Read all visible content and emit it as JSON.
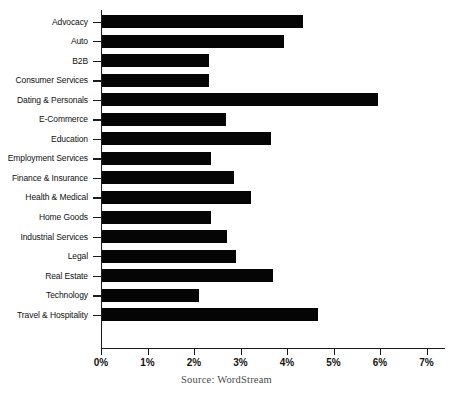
{
  "chart_data": {
    "type": "bar",
    "orientation": "horizontal",
    "title": "",
    "subtitle": "",
    "xlabel": "",
    "ylabel": "",
    "xlim": [
      0,
      7.4
    ],
    "ylim": null,
    "grid": false,
    "legend": null,
    "legend_position": "none",
    "bar_color": "#050505",
    "axis_color": "#1a1a1a",
    "categories": [
      "Advocacy",
      "Auto",
      "B2B",
      "Consumer Services",
      "Dating & Personals",
      "E-Commerce",
      "Education",
      "Employment Services",
      "Finance & Insurance",
      "Health & Medical",
      "Home Goods",
      "Industrial Services",
      "Legal",
      "Real Estate",
      "Technology",
      "Travel & Hospitality"
    ],
    "values": [
      4.32,
      3.91,
      2.3,
      2.31,
      5.94,
      2.67,
      3.63,
      2.34,
      2.84,
      3.2,
      2.34,
      2.69,
      2.88,
      3.68,
      2.08,
      4.65
    ],
    "value_unit": "%",
    "xticks": [
      0,
      1,
      2,
      3,
      4,
      5,
      6,
      7
    ],
    "xticklabels": [
      "0%",
      "1%",
      "2%",
      "3%",
      "4%",
      "5%",
      "6%",
      "7%"
    ]
  },
  "annotations": {
    "source": "Source: WordStream"
  }
}
